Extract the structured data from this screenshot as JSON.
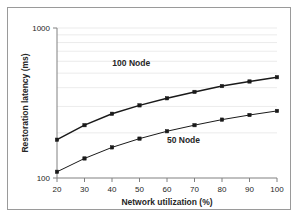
{
  "chart_data": {
    "type": "line",
    "title": "",
    "xlabel": "Network utilization (%)",
    "ylabel": "Restoration latency (ms)",
    "x": [
      20,
      30,
      40,
      50,
      60,
      70,
      80,
      90,
      100
    ],
    "xlim": [
      20,
      100
    ],
    "xticks": [
      "20",
      "30",
      "40",
      "50",
      "60",
      "70",
      "80",
      "90",
      "100"
    ],
    "ylim": [
      100,
      1000
    ],
    "yscale": "log",
    "yticks": [
      "100",
      "1000"
    ],
    "ytick_values": [
      100,
      1000
    ],
    "gridlines": [
      200,
      300,
      400,
      500,
      600,
      700,
      800,
      900
    ],
    "grid": true,
    "legend_position": "inline-annotation",
    "series": [
      {
        "name": "100 Node",
        "label": "100 Node",
        "color": "#1a1a1a",
        "marker": "square",
        "values": [
          180,
          225,
          268,
          305,
          340,
          375,
          410,
          440,
          470
        ]
      },
      {
        "name": "50 Node",
        "label": "50 Node",
        "color": "#1a1a1a",
        "marker": "square",
        "values": [
          110,
          135,
          160,
          183,
          205,
          225,
          245,
          263,
          280
        ]
      }
    ],
    "annotations": [
      {
        "text": "100 Node",
        "x": 47,
        "y": 560
      },
      {
        "text": "50 Node",
        "x": 66,
        "y": 170
      }
    ]
  }
}
